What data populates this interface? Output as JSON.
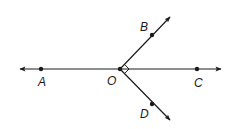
{
  "diagram": {
    "type": "geometry-rays",
    "line_color": "#1a1a1a",
    "background": "#ffffff",
    "points": [
      {
        "id": "A",
        "label": "A",
        "x": 41,
        "y": 69,
        "lx": 38,
        "ly": 86
      },
      {
        "id": "O",
        "label": "O",
        "x": 120,
        "y": 69,
        "lx": 107,
        "ly": 85
      },
      {
        "id": "C",
        "label": "C",
        "x": 197,
        "y": 69,
        "lx": 194,
        "ly": 87
      },
      {
        "id": "B",
        "label": "B",
        "x": 152,
        "y": 35,
        "lx": 140,
        "ly": 31
      },
      {
        "id": "D",
        "label": "D",
        "x": 152,
        "y": 104,
        "lx": 140,
        "ly": 118
      }
    ],
    "lines": [
      {
        "name": "line-AC",
        "description": "Line through A, O, C with arrows at both ends"
      },
      {
        "name": "ray-OB",
        "description": "Ray from O through B"
      },
      {
        "name": "ray-OD",
        "description": "Ray from O through D"
      }
    ],
    "right_angle": {
      "vertex": "O",
      "between": [
        "B",
        "D"
      ]
    }
  }
}
